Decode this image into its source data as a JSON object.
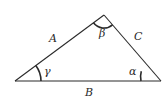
{
  "diagram": {
    "type": "triangle",
    "stroke_color": "#2a2a2a",
    "vertices": {
      "left": [
        15,
        81
      ],
      "top": [
        104,
        15
      ],
      "right": [
        161,
        81
      ]
    },
    "sides": {
      "A": "A",
      "B": "B",
      "C": "C"
    },
    "angles": {
      "alpha": "α",
      "beta": "β",
      "gamma": "γ"
    }
  }
}
